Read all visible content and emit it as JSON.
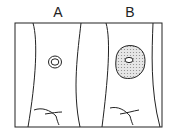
{
  "diagram": {
    "panels": [
      {
        "label": "A",
        "description": "cell with small nucleus/vacuole"
      },
      {
        "label": "B",
        "description": "cell with large shaded region around nucleus"
      }
    ],
    "colors": {
      "stroke": "#222222",
      "shade": "#cfcfcf",
      "background": "#ffffff"
    }
  }
}
